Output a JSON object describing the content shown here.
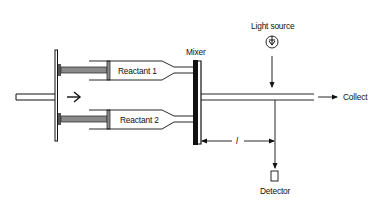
{
  "diagram": {
    "type": "stopped-flow apparatus schematic",
    "labels": {
      "reactant_1": "Reactant 1",
      "reactant_2": "Reactant 2",
      "mixer": "Mixer",
      "light_source": "Light source",
      "collect": "Collect",
      "distance": "l",
      "detector": "Detector"
    },
    "colors": {
      "line": "#111111",
      "plunger_fill": "#8a8a8a",
      "mixer_fill": "#111111",
      "background": "#ffffff"
    },
    "nodes": [
      {
        "id": "drive-plate",
        "kind": "plunger drive plate"
      },
      {
        "id": "syringe-1",
        "label": "Reactant 1"
      },
      {
        "id": "syringe-2",
        "label": "Reactant 2"
      },
      {
        "id": "mixer",
        "label": "Mixer"
      },
      {
        "id": "observation-tube"
      },
      {
        "id": "light-source",
        "label": "Light source"
      },
      {
        "id": "detector",
        "label": "Detector"
      },
      {
        "id": "collect",
        "label": "Collect"
      }
    ],
    "edges": [
      {
        "from": "drive-plate",
        "to": "syringe-1",
        "kind": "push"
      },
      {
        "from": "drive-plate",
        "to": "syringe-2",
        "kind": "push"
      },
      {
        "from": "syringe-1",
        "to": "mixer"
      },
      {
        "from": "syringe-2",
        "to": "mixer"
      },
      {
        "from": "mixer",
        "to": "observation-tube"
      },
      {
        "from": "observation-tube",
        "to": "collect",
        "kind": "arrow"
      },
      {
        "from": "light-source",
        "to": "observation-tube",
        "kind": "arrow"
      },
      {
        "from": "observation-tube",
        "to": "detector",
        "kind": "arrow"
      },
      {
        "from": "mixer",
        "to": "detector",
        "kind": "dimension",
        "label": "l"
      }
    ]
  }
}
